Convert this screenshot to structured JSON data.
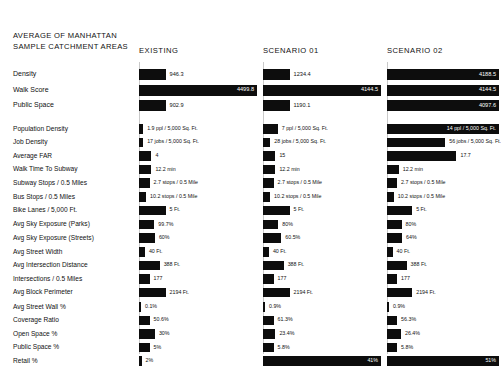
{
  "header": {
    "title": "AVERAGE OF MANHATTAN\nSAMPLE CATCHMENT AREAS",
    "columns": [
      "EXISTING",
      "SCENARIO 01",
      "SCENARIO 02"
    ]
  },
  "style": {
    "bar_color": "#0d0d0d",
    "guide_color": "#c9c9c9",
    "background": "#ffffff"
  },
  "chart_data": {
    "type": "bar",
    "title": "AVERAGE OF MANHATTAN SAMPLE CATCHMENT AREAS",
    "xlabel": "",
    "ylabel": "",
    "orientation": "horizontal",
    "grid": false,
    "legend": "none",
    "series": [
      "EXISTING",
      "SCENARIO 01",
      "SCENARIO 02"
    ],
    "groups": [
      {
        "name": "summary",
        "rows": [
          {
            "metric": "Density",
            "values": [
              946.3,
              1234.4,
              4188.5
            ],
            "labels": [
              "946.3",
              "1234.4",
              "4188.5"
            ],
            "fractions": [
              0.225,
              0.225,
              1.0
            ]
          },
          {
            "metric": "Walk Score",
            "values": [
              4499.8,
              4144.5,
              4144.5
            ],
            "labels": [
              "4499.8",
              "4144.5",
              "4144.5"
            ],
            "fractions": [
              1.0,
              1.0,
              1.0
            ]
          },
          {
            "metric": "Public Space",
            "values": [
              902.9,
              1190.1,
              4097.6
            ],
            "labels": [
              "902.9",
              "1190.1",
              "4097.6"
            ],
            "fractions": [
              0.225,
              0.225,
              1.0
            ]
          }
        ]
      },
      {
        "name": "metrics",
        "rows": [
          {
            "metric": "Population Density",
            "labels": [
              "1.9 ppl / 5,000 Sq. Ft.",
              "7 ppl / 5,000 Sq. Ft.",
              "14 ppl / 5,000 Sq. Ft."
            ],
            "values": [
              1.9,
              7,
              14
            ],
            "fractions": [
              0.035,
              0.125,
              1.0
            ],
            "label_inside": [
              false,
              false,
              true
            ]
          },
          {
            "metric": "Job Density",
            "labels": [
              "17 jobs / 5,000 Sq. Ft.",
              "28 jobs / 5,000 Sq. Ft.",
              "56 jobs / 5,000 Sq. Ft."
            ],
            "values": [
              17,
              28,
              56
            ],
            "fractions": [
              0.035,
              0.062,
              0.52
            ],
            "label_inside": [
              false,
              false,
              false
            ]
          },
          {
            "metric": "Average FAR",
            "labels": [
              "4",
              "15",
              "17.7"
            ],
            "values": [
              4,
              15,
              17.7
            ],
            "fractions": [
              0.105,
              0.105,
              0.62
            ],
            "label_inside": [
              false,
              false,
              false
            ]
          },
          {
            "metric": "Walk Time To Subway",
            "labels": [
              "12.2 min",
              "12.2 min",
              "12.2 min"
            ],
            "values": [
              12.2,
              12.2,
              12.2
            ],
            "fractions": [
              0.105,
              0.105,
              0.105
            ],
            "label_inside": [
              false,
              false,
              false
            ]
          },
          {
            "metric": "Subway Stops / 0.5 Miles",
            "labels": [
              "2.7 stops / 0.5 Mile",
              "2.7 stops / 0.5 Mile",
              "2.7 stops / 0.5 Mile"
            ],
            "values": [
              2.7,
              2.7,
              2.7
            ],
            "fractions": [
              0.09,
              0.09,
              0.09
            ],
            "label_inside": [
              false,
              false,
              false
            ]
          },
          {
            "metric": "Bus Stops / 0.5 Miles",
            "labels": [
              "10.2 stops / 0.5 Mile",
              "10.2 stops / 0.5 Mile",
              "10.2 stops / 0.5 Mile"
            ],
            "values": [
              10.2,
              10.2,
              10.2
            ],
            "fractions": [
              0.06,
              0.06,
              0.06
            ],
            "label_inside": [
              false,
              false,
              false
            ]
          },
          {
            "metric": "Bike Lanes / 5,000 Ft.",
            "labels": [
              "5 Ft.",
              "5 Ft.",
              "5 Ft."
            ],
            "values": [
              5,
              5,
              5
            ],
            "fractions": [
              0.225,
              0.225,
              0.225
            ],
            "label_inside": [
              false,
              false,
              false
            ]
          },
          {
            "metric": "Avg Sky Exposure (Parks)",
            "labels": [
              "99.7%",
              "80%",
              "80%"
            ],
            "values": [
              99.7,
              80,
              80
            ],
            "fractions": [
              0.13,
              0.13,
              0.13
            ],
            "label_inside": [
              false,
              false,
              false
            ]
          },
          {
            "metric": "Avg Sky Exposure (Streets)",
            "labels": [
              "60%",
              "60.5%",
              "64%"
            ],
            "values": [
              60,
              60.5,
              64
            ],
            "fractions": [
              0.135,
              0.155,
              0.135
            ],
            "label_inside": [
              false,
              false,
              false
            ]
          },
          {
            "metric": "Avg Street Width",
            "labels": [
              "40 Ft.",
              "40 Ft.",
              "40 Ft."
            ],
            "values": [
              40,
              40,
              40
            ],
            "fractions": [
              0.05,
              0.05,
              0.05
            ],
            "label_inside": [
              false,
              false,
              false
            ]
          },
          {
            "metric": "Avg Intersection Distance",
            "labels": [
              "388 Ft.",
              "388 Ft.",
              "388 Ft."
            ],
            "values": [
              388,
              388,
              388
            ],
            "fractions": [
              0.175,
              0.175,
              0.175
            ],
            "label_inside": [
              false,
              false,
              false
            ]
          },
          {
            "metric": "Intersections / 0.5 Miles",
            "labels": [
              "177",
              "177",
              "177"
            ],
            "values": [
              177,
              177,
              177
            ],
            "fractions": [
              0.09,
              0.09,
              0.09
            ],
            "label_inside": [
              false,
              false,
              false
            ]
          },
          {
            "metric": "Avg Block Perimeter",
            "labels": [
              "2194 Ft.",
              "2194 Ft.",
              "2194 Ft."
            ],
            "values": [
              2194,
              2194,
              2194
            ],
            "fractions": [
              0.225,
              0.225,
              0.225
            ],
            "label_inside": [
              false,
              false,
              false
            ]
          },
          {
            "metric": "Avg Street Wall %",
            "labels": [
              "0.1%",
              "0.9%",
              "0.9%"
            ],
            "values": [
              0.1,
              0.9,
              0.9
            ],
            "fractions": [
              0.008,
              0.008,
              0.008
            ],
            "label_inside": [
              false,
              false,
              false
            ]
          },
          {
            "metric": "Coverage Ratio",
            "labels": [
              "50.6%",
              "61.3%",
              "56.3%"
            ],
            "values": [
              50.6,
              61.3,
              56.3
            ],
            "fractions": [
              0.09,
              0.09,
              0.09
            ],
            "label_inside": [
              false,
              false,
              false
            ]
          },
          {
            "metric": "Open Space %",
            "labels": [
              "30%",
              "23.4%",
              "26.4%"
            ],
            "values": [
              30,
              23.4,
              26.4
            ],
            "fractions": [
              0.135,
              0.105,
              0.125
            ],
            "label_inside": [
              false,
              false,
              false
            ]
          },
          {
            "metric": "Public Space %",
            "labels": [
              "5%",
              "5.8%",
              "5.8%"
            ],
            "values": [
              5,
              5.8,
              5.8
            ],
            "fractions": [
              0.09,
              0.09,
              0.09
            ],
            "label_inside": [
              false,
              false,
              false
            ]
          },
          {
            "metric": "Retail %",
            "labels": [
              "2%",
              "41%",
              "51%"
            ],
            "values": [
              2,
              41,
              51
            ],
            "fractions": [
              0.022,
              1.0,
              1.0
            ],
            "label_inside": [
              false,
              true,
              true
            ]
          }
        ]
      }
    ]
  }
}
